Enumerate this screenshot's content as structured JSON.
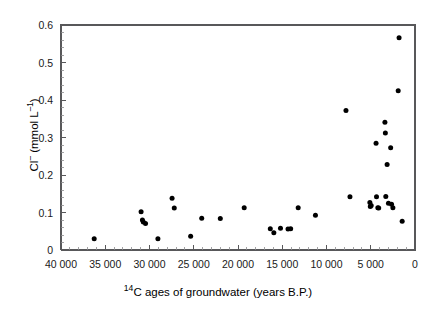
{
  "chart_data": {
    "type": "scatter",
    "title": "",
    "xlabel": "14C ages of groundwater (years B.P.)",
    "xlabel_parts": {
      "pre_sup": "14",
      "rest": "C ages of groundwater (years B.P.)"
    },
    "ylabel": "Cl- (mmol L-1)",
    "ylabel_parts": {
      "symbol": "Cl",
      "charge": "–",
      "open": " (mmol L",
      "exp": "–1",
      "close": ")"
    },
    "xlim": [
      40000,
      0
    ],
    "ylim": [
      0,
      0.6
    ],
    "x_reversed": true,
    "grid": false,
    "legend": null,
    "x_ticks": [
      40000,
      35000,
      30000,
      25000,
      20000,
      15000,
      10000,
      5000,
      0
    ],
    "x_tick_labels": [
      "40 000",
      "35 000",
      "30 000",
      "25 000",
      "20 000",
      "15 000",
      "10 000",
      "5 000",
      "0"
    ],
    "x_minor_interval": 1000,
    "y_ticks": [
      0,
      0.1,
      0.2,
      0.3,
      0.4,
      0.5,
      0.6
    ],
    "y_tick_labels": [
      "0",
      "0.1",
      "0.2",
      "0.3",
      "0.4",
      "0.5",
      "0.6"
    ],
    "y_minor_interval": 0.02,
    "marker": {
      "shape": "circle",
      "color": "#000000",
      "size_px": 4.6
    },
    "series": [
      {
        "name": "Groundwater samples",
        "points": [
          [
            36250,
            0.03
          ],
          [
            30950,
            0.102
          ],
          [
            30800,
            0.08
          ],
          [
            30700,
            0.075
          ],
          [
            30450,
            0.071
          ],
          [
            29050,
            0.03
          ],
          [
            27450,
            0.138
          ],
          [
            27200,
            0.112
          ],
          [
            25350,
            0.037
          ],
          [
            24100,
            0.085
          ],
          [
            22000,
            0.084
          ],
          [
            19300,
            0.113
          ],
          [
            16350,
            0.057
          ],
          [
            15950,
            0.046
          ],
          [
            15200,
            0.058
          ],
          [
            14350,
            0.056
          ],
          [
            14050,
            0.057
          ],
          [
            13200,
            0.113
          ],
          [
            11250,
            0.093
          ],
          [
            7800,
            0.372
          ],
          [
            7350,
            0.142
          ],
          [
            5100,
            0.127
          ],
          [
            5050,
            0.116
          ],
          [
            4950,
            0.119
          ],
          [
            4400,
            0.285
          ],
          [
            4350,
            0.142
          ],
          [
            4200,
            0.113
          ],
          [
            4100,
            0.112
          ],
          [
            3400,
            0.341
          ],
          [
            3350,
            0.312
          ],
          [
            3300,
            0.143
          ],
          [
            3150,
            0.228
          ],
          [
            3000,
            0.125
          ],
          [
            2750,
            0.273
          ],
          [
            2650,
            0.122
          ],
          [
            2500,
            0.113
          ],
          [
            1900,
            0.425
          ],
          [
            1800,
            0.566
          ],
          [
            1450,
            0.077
          ]
        ]
      }
    ]
  },
  "figure": {
    "plot_area": {
      "left": 61,
      "top": 25,
      "right": 415,
      "bottom": 250
    }
  }
}
